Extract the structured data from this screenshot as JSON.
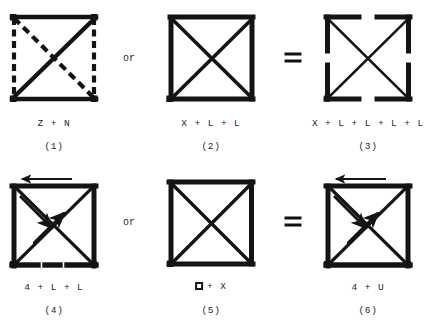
{
  "figure": {
    "width": 442,
    "height": 333,
    "background": "#ffffff",
    "ink_color": "#141414"
  },
  "connectors": {
    "row1_or": "or",
    "row1_equals": "=",
    "row2_or": "or",
    "row2_equals": "="
  },
  "panels": [
    {
      "id": "panel-1",
      "number": "(1)",
      "formula": "Z + N",
      "formula_prefix": "",
      "has_square_glyph": false,
      "description": "square with solid top, bottom and anti-diagonal (Z) plus dashed left, right and main diagonal (N)",
      "cx": 54,
      "cy": 58,
      "size": 84,
      "strokes": [
        {
          "name": "top-edge",
          "style": "solid"
        },
        {
          "name": "bottom-edge",
          "style": "solid"
        },
        {
          "name": "anti-diagonal",
          "style": "solid"
        },
        {
          "name": "left-edge",
          "style": "dashed"
        },
        {
          "name": "right-edge",
          "style": "dashed"
        },
        {
          "name": "main-diagonal",
          "style": "dashed"
        }
      ]
    },
    {
      "id": "panel-2",
      "number": "(2)",
      "formula": "X + L + L",
      "formula_prefix": "",
      "has_square_glyph": false,
      "description": "solid square with both diagonals, formed from an X and two L brackets",
      "cx": 211,
      "cy": 58,
      "size": 84,
      "strokes": [
        {
          "name": "top-edge",
          "style": "solid"
        },
        {
          "name": "bottom-edge",
          "style": "solid"
        },
        {
          "name": "left-edge",
          "style": "solid"
        },
        {
          "name": "right-edge",
          "style": "solid"
        },
        {
          "name": "main-diagonal",
          "style": "solid"
        },
        {
          "name": "anti-diagonal",
          "style": "solid"
        }
      ]
    },
    {
      "id": "panel-3",
      "number": "(3)",
      "formula": "X + L + L + L + L",
      "formula_prefix": "",
      "has_square_glyph": false,
      "description": "four corner L brackets with gaps at edge midpoints plus thin X diagonals",
      "cx": 368,
      "cy": 58,
      "size": 84,
      "strokes": [
        {
          "name": "corner-bracket-top-left",
          "style": "solid"
        },
        {
          "name": "corner-bracket-top-right",
          "style": "solid"
        },
        {
          "name": "corner-bracket-bottom-left",
          "style": "solid"
        },
        {
          "name": "corner-bracket-bottom-right",
          "style": "solid"
        },
        {
          "name": "main-diagonal",
          "style": "thin"
        },
        {
          "name": "anti-diagonal",
          "style": "thin"
        }
      ]
    },
    {
      "id": "panel-4",
      "number": "(4)",
      "formula": "4 + L + L",
      "formula_prefix": "",
      "has_square_glyph": false,
      "description": "square with X, a leftward arrow above the top edge, a double diagonal U-arrow, and two gaps in the bottom edge",
      "cx": 54,
      "cy": 222,
      "size": 84,
      "strokes": [
        {
          "name": "top-edge",
          "style": "solid"
        },
        {
          "name": "left-edge",
          "style": "solid"
        },
        {
          "name": "right-edge",
          "style": "solid"
        },
        {
          "name": "bottom-edge-gapped",
          "style": "solid"
        },
        {
          "name": "main-diagonal",
          "style": "solid"
        },
        {
          "name": "anti-diagonal",
          "style": "solid"
        },
        {
          "name": "top-arrow-left",
          "style": "arrow"
        },
        {
          "name": "diagonal-arrow-down",
          "style": "arrow"
        },
        {
          "name": "diagonal-arrow-up",
          "style": "arrow"
        }
      ]
    },
    {
      "id": "panel-5",
      "number": "(5)",
      "formula": "+ X",
      "formula_prefix": "square-glyph",
      "has_square_glyph": true,
      "description": "plain solid square with both diagonals",
      "cx": 211,
      "cy": 222,
      "size": 84,
      "strokes": [
        {
          "name": "top-edge",
          "style": "solid"
        },
        {
          "name": "bottom-edge",
          "style": "solid"
        },
        {
          "name": "left-edge",
          "style": "solid"
        },
        {
          "name": "right-edge",
          "style": "solid"
        },
        {
          "name": "main-diagonal",
          "style": "solid"
        },
        {
          "name": "anti-diagonal",
          "style": "solid"
        }
      ]
    },
    {
      "id": "panel-6",
      "number": "(6)",
      "formula": "4 + U",
      "formula_prefix": "",
      "has_square_glyph": false,
      "description": "closed square with X, a leftward arrow above the top edge and a double diagonal U-arrow",
      "cx": 368,
      "cy": 222,
      "size": 84,
      "strokes": [
        {
          "name": "top-edge",
          "style": "solid"
        },
        {
          "name": "bottom-edge",
          "style": "solid"
        },
        {
          "name": "left-edge",
          "style": "solid"
        },
        {
          "name": "right-edge",
          "style": "solid"
        },
        {
          "name": "main-diagonal",
          "style": "solid"
        },
        {
          "name": "anti-diagonal",
          "style": "solid"
        },
        {
          "name": "top-arrow-left",
          "style": "arrow"
        },
        {
          "name": "diagonal-arrow-down",
          "style": "arrow"
        },
        {
          "name": "diagonal-arrow-up",
          "style": "arrow"
        }
      ]
    }
  ]
}
